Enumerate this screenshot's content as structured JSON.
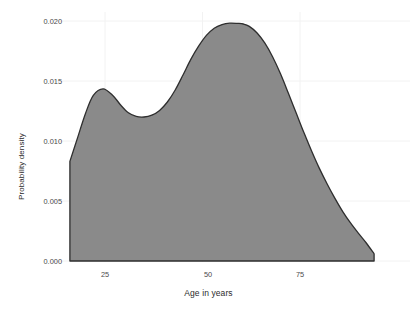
{
  "chart_data": {
    "type": "area",
    "title": "",
    "xlabel": "Age in years",
    "ylabel": "Probability density",
    "xlim": [
      14,
      96
    ],
    "ylim": [
      0.0,
      0.0205
    ],
    "grid": true,
    "legend": null,
    "xticks": [
      25,
      50,
      75
    ],
    "xtick_labels": [
      "25",
      "50",
      "75"
    ],
    "yticks": [
      0.0,
      0.005,
      0.01,
      0.015,
      0.02
    ],
    "ytick_labels": [
      "0.000",
      "0.005",
      "0.010",
      "0.015",
      "0.020"
    ],
    "series": [
      {
        "name": "Age density",
        "fill_color": "#8a8a8a",
        "line_color": "#2e2e2e",
        "x": [
          16.0,
          18.0,
          20.0,
          22.0,
          24.5,
          27.0,
          29.0,
          31.0,
          33.0,
          35.0,
          37.0,
          39.0,
          41.0,
          43.0,
          45.0,
          47.0,
          49.0,
          51.0,
          53.0,
          55.0,
          57.0,
          59.0,
          60.5,
          62.0,
          64.0,
          66.0,
          68.0,
          70.0,
          72.0,
          74.0,
          76.0,
          78.0,
          80.0,
          82.0,
          84.0,
          86.0,
          88.0,
          90.0,
          92.0,
          94.0
        ],
        "y": [
          0.0083,
          0.0103,
          0.0123,
          0.0138,
          0.01435,
          0.0138,
          0.013,
          0.01235,
          0.01205,
          0.012,
          0.01215,
          0.01255,
          0.01325,
          0.01425,
          0.0155,
          0.0168,
          0.0179,
          0.0188,
          0.0194,
          0.0197,
          0.01982,
          0.0198,
          0.01975,
          0.01955,
          0.019,
          0.01815,
          0.017,
          0.0156,
          0.014,
          0.01235,
          0.0107,
          0.00915,
          0.0077,
          0.0064,
          0.0052,
          0.0041,
          0.00315,
          0.0023,
          0.0015,
          0.0006
        ]
      }
    ]
  },
  "axes": {
    "x_title": "Age in years",
    "y_title": "Probability density",
    "x_tick_labels": [
      "25",
      "50",
      "75"
    ],
    "y_tick_labels": [
      "0.000",
      "0.005",
      "0.010",
      "0.015",
      "0.020"
    ]
  },
  "colors": {
    "background": "#ffffff",
    "fill": "#8a8a8a",
    "outline": "#2e2e2e",
    "grid": "#f2f2f2",
    "tick_text": "#4a4a4a",
    "title_text": "#2b2b2b"
  }
}
